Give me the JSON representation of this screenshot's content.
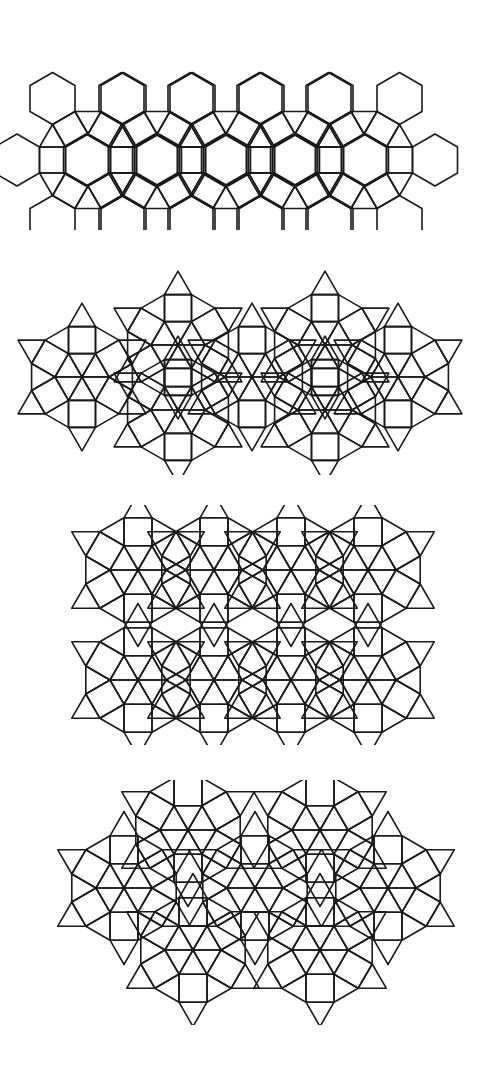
{
  "figure": {
    "background": "#ffffff",
    "stroke_color": "#1a1a1a",
    "panels": [
      {
        "id": "tiling-1",
        "description": "band of hexagons, squares and triangles (3.4.6.4 rosettes)",
        "top": 30,
        "height": 200,
        "type": "hex-rosette",
        "edge": 26,
        "rosettes": [
          [
            88,
            130
          ],
          [
            226,
            130
          ],
          [
            364,
            130
          ]
        ],
        "in_between": [
          [
            157,
            130
          ],
          [
            295,
            130
          ]
        ]
      },
      {
        "id": "tiling-2",
        "description": "rounded band of squares and triangles (dodecagonal wheels)",
        "top": 265,
        "height": 210,
        "type": "wheel",
        "edge": 27,
        "wheels": [
          [
            82,
            112
          ],
          [
            178,
            80
          ],
          [
            178,
            145
          ],
          [
            252,
            112
          ],
          [
            325,
            80
          ],
          [
            325,
            145
          ],
          [
            398,
            112
          ]
        ]
      },
      {
        "id": "tiling-3",
        "description": "rectangular patch of eight dodecagonal wheels in 2 rows",
        "top": 505,
        "height": 240,
        "type": "wheel",
        "edge": 28,
        "wheels": [
          [
            138,
            65
          ],
          [
            214,
            65
          ],
          [
            291,
            65
          ],
          [
            368,
            65
          ],
          [
            138,
            175
          ],
          [
            214,
            175
          ],
          [
            291,
            175
          ],
          [
            368,
            175
          ]
        ]
      },
      {
        "id": "tiling-4",
        "description": "irregular patch of squares and triangles with dodecagonal wheels",
        "top": 780,
        "height": 245,
        "type": "wheel",
        "edge": 28,
        "wheels": [
          [
            124,
            108
          ],
          [
            188,
            50
          ],
          [
            255,
            108
          ],
          [
            320,
            50
          ],
          [
            388,
            108
          ],
          [
            193,
            170
          ],
          [
            320,
            170
          ]
        ]
      }
    ]
  }
}
